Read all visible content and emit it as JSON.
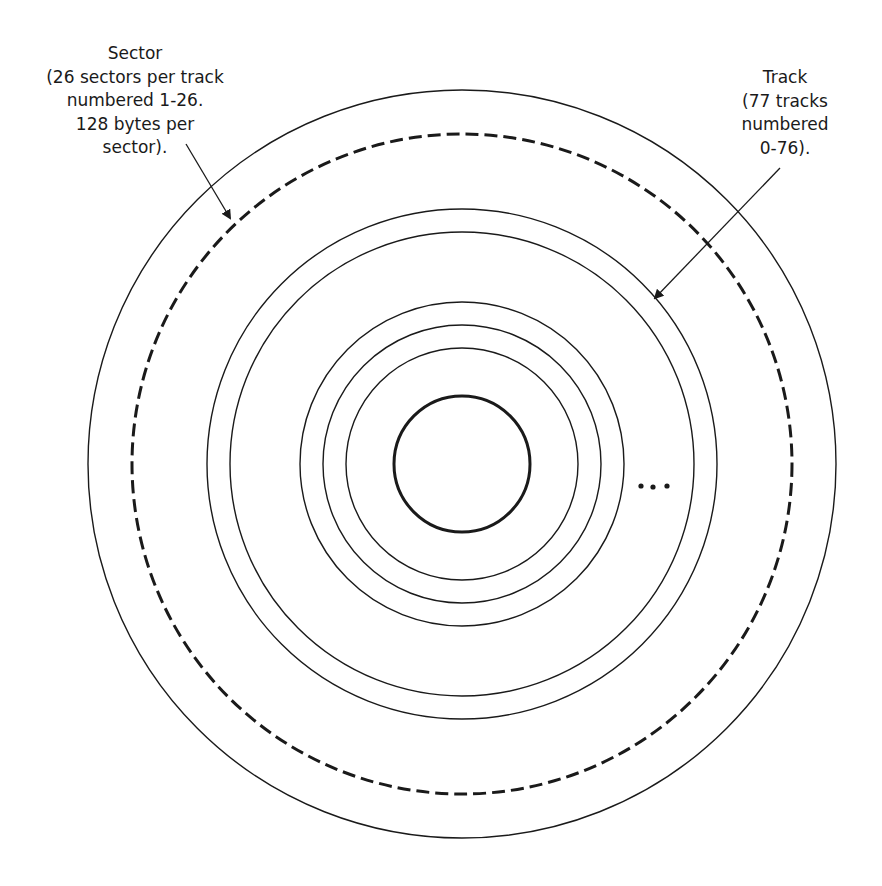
{
  "diagram": {
    "colors": {
      "stroke": "#1a1a1a",
      "background": "#ffffff"
    },
    "center": {
      "x": 462,
      "y": 464
    },
    "circles": [
      {
        "name": "disk-outer-edge",
        "r": 374,
        "stroke_width": 1.4,
        "dashed": false
      },
      {
        "name": "sector-track-dashed",
        "r": 330,
        "stroke_width": 3,
        "dashed": true
      },
      {
        "name": "track-ring-1",
        "r": 255,
        "stroke_width": 1.4,
        "dashed": false
      },
      {
        "name": "track-ring-2",
        "r": 232,
        "stroke_width": 1.4,
        "dashed": false
      },
      {
        "name": "track-ring-3",
        "r": 162,
        "stroke_width": 1.4,
        "dashed": false
      },
      {
        "name": "track-ring-4",
        "r": 139,
        "stroke_width": 1.4,
        "dashed": false
      },
      {
        "name": "track-ring-5",
        "r": 116,
        "stroke_width": 1.4,
        "dashed": false
      },
      {
        "name": "hub-hole",
        "r": 68,
        "stroke_width": 3,
        "dashed": false
      }
    ],
    "ellipsis": "...",
    "labels": {
      "sector": {
        "lines": [
          "Sector",
          "(26 sectors per track",
          "numbered 1-26.",
          "128 bytes per",
          "sector)."
        ]
      },
      "track": {
        "lines": [
          "Track",
          "(77 tracks",
          "numbered",
          "0-76)."
        ]
      }
    },
    "arrows": {
      "sector": {
        "from": [
          186,
          144
        ],
        "to": [
          230,
          218
        ]
      },
      "track": {
        "from": [
          780,
          168
        ],
        "to": [
          655,
          298
        ]
      }
    }
  }
}
